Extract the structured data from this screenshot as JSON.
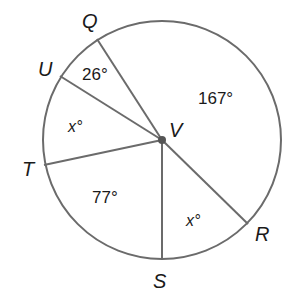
{
  "diagram": {
    "type": "circle-central-angles",
    "center": {
      "label": "V",
      "x": 162,
      "y": 140
    },
    "radius": 119,
    "stroke_color": "#6b6b6b",
    "points": [
      {
        "label": "Q",
        "x": 97,
        "y": 39,
        "label_x": 82,
        "label_y": 28
      },
      {
        "label": "U",
        "x": 60,
        "y": 76,
        "label_x": 38,
        "label_y": 76
      },
      {
        "label": "T",
        "x": 44,
        "y": 165,
        "label_x": 22,
        "label_y": 176
      },
      {
        "label": "S",
        "x": 162,
        "y": 259,
        "label_x": 153,
        "label_y": 288
      },
      {
        "label": "R",
        "x": 248,
        "y": 224,
        "label_x": 255,
        "label_y": 241
      }
    ],
    "angle_labels": [
      {
        "text": "26°",
        "x": 82,
        "y": 80,
        "between": "Q-U"
      },
      {
        "text": "x°",
        "x": 68,
        "y": 132,
        "between": "U-T",
        "variable": true
      },
      {
        "text": "77°",
        "x": 92,
        "y": 203,
        "between": "T-S"
      },
      {
        "text": "x°",
        "x": 186,
        "y": 226,
        "between": "S-R",
        "variable": true
      },
      {
        "text": "167°",
        "x": 198,
        "y": 104,
        "between": "R-Q"
      }
    ]
  }
}
